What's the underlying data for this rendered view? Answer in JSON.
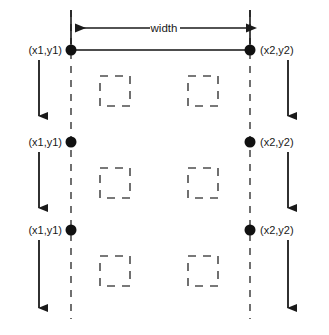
{
  "diagram": {
    "canvas": {
      "width": 329,
      "height": 335,
      "background": "#ffffff"
    },
    "colors": {
      "ink": "#1a1a1a",
      "line": "#333333",
      "dashed": "#4d4d4d",
      "background": "#ffffff"
    },
    "labels": {
      "width": "width",
      "top_left_point": "(x1,y1)",
      "top_right_point": "(x2,y2)",
      "middle_left_point": "(x1,y1)",
      "middle_right_point": "(x2,y2)",
      "bottom_left_point": "(x1,y1)",
      "bottom_right_point": "(x2,y2)"
    },
    "geometry": {
      "left_guide_x": 71,
      "right_guide_x": 250,
      "guide_top_y": 10,
      "guide_bottom_y": 319,
      "width_dimension_y": 28,
      "row_y": [
        50,
        142,
        230
      ],
      "left_arrow_x": 39,
      "right_arrow_x": 288,
      "arrow_spans": [
        [
          60,
          126
        ],
        [
          152,
          218
        ],
        [
          240,
          318
        ]
      ],
      "square_size": 30,
      "square_left_x": 100,
      "square_right_x": 188,
      "square_rows_y": [
        76,
        168,
        256
      ]
    },
    "points": [
      {
        "id": "p-top-left",
        "x": 71,
        "y": 50
      },
      {
        "id": "p-top-right",
        "x": 250,
        "y": 50
      },
      {
        "id": "p-mid-left",
        "x": 71,
        "y": 142
      },
      {
        "id": "p-mid-right",
        "x": 250,
        "y": 142
      },
      {
        "id": "p-bot-left",
        "x": 71,
        "y": 230
      },
      {
        "id": "p-bot-right",
        "x": 250,
        "y": 230
      }
    ]
  }
}
